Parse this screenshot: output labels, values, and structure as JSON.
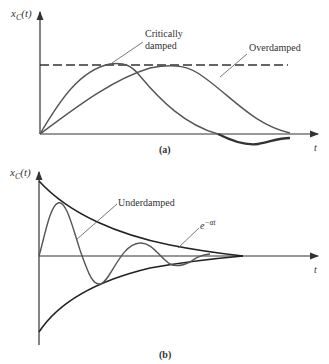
{
  "figure": {
    "panel_a": {
      "caption": "(a)",
      "y_axis_label": {
        "main": "x",
        "sub": "C",
        "arg": "(t)"
      },
      "x_axis_label": "t",
      "curves": [
        {
          "name": "Critically damped",
          "label_line1": "Critically",
          "label_line2": "damped"
        },
        {
          "name": "Overdamped",
          "label": "Overdamped"
        }
      ],
      "reference_line": "dashed steady-state level"
    },
    "panel_b": {
      "caption": "(b)",
      "y_axis_label": {
        "main": "x",
        "sub": "C",
        "arg": "(t)"
      },
      "x_axis_label": "t",
      "curves": [
        {
          "name": "Underdamped",
          "label": "Underdamped"
        },
        {
          "name": "Envelope",
          "label_base": "e",
          "label_exp": "−αt"
        }
      ]
    },
    "colors": {
      "curve": "#555555",
      "axis": "#333333",
      "envelope": "#222222",
      "background": "#ffffff"
    }
  }
}
